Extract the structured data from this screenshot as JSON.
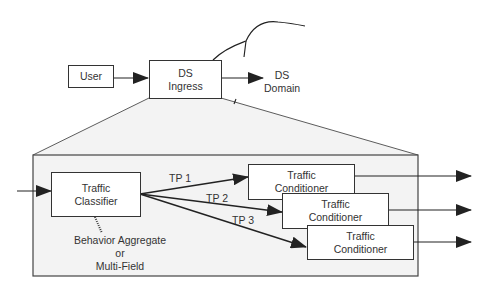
{
  "diagram": {
    "top": {
      "user": {
        "label": "User"
      },
      "ingress": {
        "line1": "DS",
        "line2": "Ingress"
      },
      "domain": {
        "line1": "DS",
        "line2": "Domain"
      }
    },
    "detail": {
      "classifier": {
        "line1": "Traffic",
        "line2": "Classifier"
      },
      "classifier_note": {
        "line1": "Behavior Aggregate",
        "line2": "or",
        "line3": "Multi-Field"
      },
      "paths": [
        {
          "label": "TP 1"
        },
        {
          "label": "TP 2"
        },
        {
          "label": "TP 3"
        }
      ],
      "conditioners": [
        {
          "line1": "Traffic",
          "line2": "Conditioner"
        },
        {
          "line1": "Traffic",
          "line2": "Conditioner"
        },
        {
          "line1": "Traffic",
          "line2": "Conditioner"
        }
      ]
    },
    "colors": {
      "stroke": "#333333",
      "frame_fill": "#f3f3f3",
      "box_fill": "#ffffff"
    }
  }
}
